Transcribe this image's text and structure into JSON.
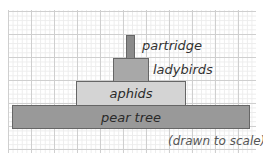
{
  "diagram": {
    "type": "pyramid of numbers/biomass",
    "note": "(drawn to scale)",
    "levels": [
      {
        "name": "partridge",
        "color": "#8a8a8a",
        "label_position": "outside-right"
      },
      {
        "name": "ladybirds",
        "color": "#a8a8a8",
        "label_position": "outside-right"
      },
      {
        "name": "aphids",
        "color": "#d4d4d4",
        "label_position": "inside"
      },
      {
        "name": "pear tree",
        "color": "#999999",
        "label_position": "inside"
      }
    ]
  }
}
